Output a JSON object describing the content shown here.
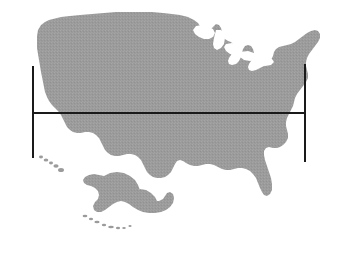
{
  "figure": {
    "kind": "map-figure",
    "title": "United States map silhouette with horizontal width measurement",
    "width_px": 350,
    "height_px": 257
  },
  "colors": {
    "background": "#ffffff",
    "land_fill": "#9b9b9b",
    "land_fill_light": "#a8a8a8",
    "measure_stroke": "#1a1a1a"
  },
  "map": {
    "projection_note": "composite",
    "regions": [
      {
        "id": "contiguous-us",
        "label": "Contiguous United States"
      },
      {
        "id": "alaska-inset",
        "label": "Alaska"
      },
      {
        "id": "hawaii-inset",
        "label": "Hawaii"
      }
    ],
    "water_features": [
      {
        "id": "great-lakes",
        "label": "Great Lakes"
      }
    ]
  },
  "measurement": {
    "label": "",
    "value": "",
    "units": "",
    "horizontal_line": {
      "x1": 33,
      "x2": 305,
      "y": 113,
      "stroke_width": 2.4
    },
    "left_cap": {
      "x": 33,
      "y1": 66,
      "y2": 158,
      "stroke_width": 2.4
    },
    "right_cap": {
      "x": 305,
      "y1": 64,
      "y2": 162,
      "stroke_width": 2.4
    }
  }
}
